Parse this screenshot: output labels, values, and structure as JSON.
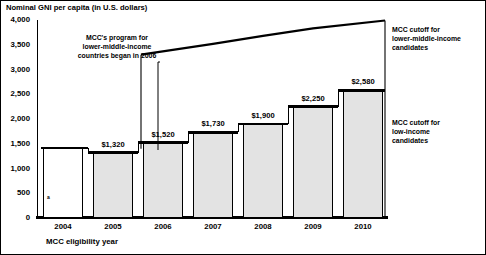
{
  "chart_data": {
    "type": "bar",
    "title": "Nominal GNI per capita (in U.S. dollars)",
    "xlabel": "MCC eligibility year",
    "ylabel": "",
    "ylim": [
      0,
      4000
    ],
    "yticks": [
      "0",
      "500",
      "1,000",
      "1,500",
      "2,000",
      "2,500",
      "3,000",
      "3,500",
      "4,000"
    ],
    "ytick_values": [
      0,
      500,
      1000,
      1500,
      2000,
      2500,
      3000,
      3500,
      4000
    ],
    "grid": false,
    "legend": "none",
    "categories": [
      "2004",
      "2005",
      "2006",
      "2007",
      "2008",
      "2009",
      "2010"
    ],
    "series": [
      {
        "name": "MCC cutoff for low-income candidates",
        "values": [
          1415,
          1320,
          1520,
          1730,
          1900,
          2250,
          2580
        ],
        "labels": [
          "",
          "$1,320",
          "$1,520",
          "$1,730",
          "$1,900",
          "$2,250",
          "$2,580"
        ],
        "footnote_marker_on": "2004"
      },
      {
        "name": "MCC cutoff for lower-middle-income candidates",
        "x": [
          "2006",
          "2007",
          "2008",
          "2009",
          "2010"
        ],
        "values": [
          3300,
          3520,
          3680,
          3830,
          3990
        ]
      }
    ],
    "annotations": [
      {
        "name": "program-start",
        "text": "MCC's program for\nlower-middle-income\ncountries began in 2006",
        "points_to": "2006"
      },
      {
        "name": "lmic-cutoff",
        "text": "MCC cutoff for\nlower-middle-income\ncandidates"
      },
      {
        "name": "lic-cutoff",
        "text": "MCC cutoff for\nlow-income\ncandidates"
      }
    ],
    "colors": {
      "bar_fill": "#e3e3e3",
      "bar_fill_2004": "#ffffff",
      "bar_stroke": "#000000",
      "cutoff_line": "#000000"
    }
  },
  "annotation_lines": {
    "program": [
      "MCC's program for",
      "lower-middle-income",
      "countries began in 2006"
    ],
    "lmic": [
      "MCC cutoff for",
      "lower-middle-income",
      "candidates"
    ],
    "lic": [
      "MCC cutoff for",
      "low-income",
      "candidates"
    ]
  },
  "footnote_marker": "a"
}
